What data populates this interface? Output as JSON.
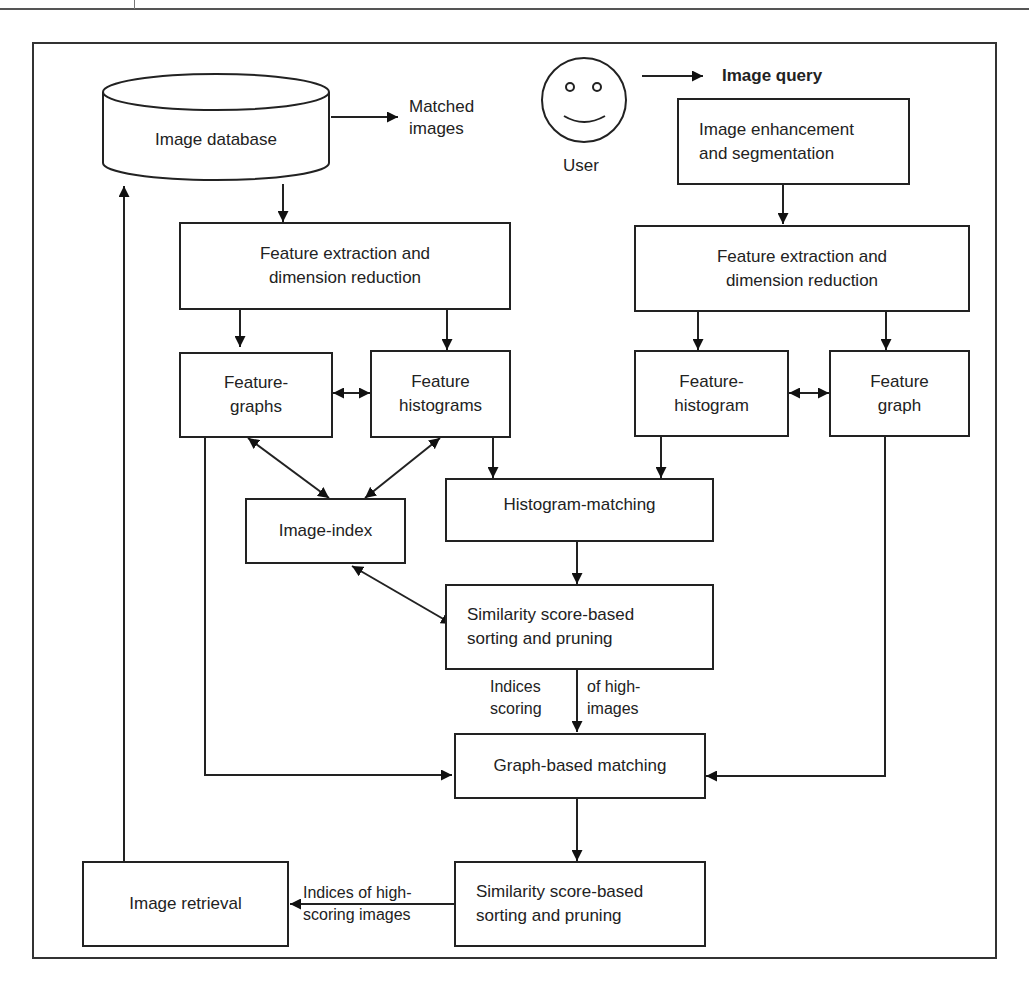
{
  "diagram": {
    "title_label": "Image query",
    "user_label": "User",
    "database": {
      "label": "Image database",
      "output_label": "Matched\nimages"
    },
    "left_pipeline": {
      "feature_extraction": "Feature extraction and\ndimension reduction",
      "feature_graphs": "Feature-\ngraphs",
      "feature_histograms": "Feature\nhistograms",
      "image_index": "Image-index"
    },
    "right_pipeline": {
      "enhancement": "Image enhancement\nand segmentation",
      "feature_extraction": "Feature extraction and\ndimension reduction",
      "feature_histogram": "Feature-\nhistogram",
      "feature_graph": "Feature\ngraph"
    },
    "center": {
      "histogram_matching": "Histogram-matching",
      "similarity_1": "Similarity score-based\nsorting and pruning",
      "indices_left": "Indices\nscoring",
      "indices_right": "of  high-\nimages",
      "graph_matching": "Graph-based matching",
      "similarity_2": "Similarity score-based\nsorting and pruning"
    },
    "retrieval": {
      "label": "Image retrieval",
      "edge_label": "Indices of  high-\nscoring images"
    }
  }
}
